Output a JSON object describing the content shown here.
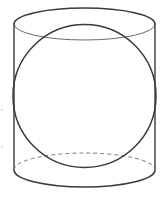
{
  "figure": {
    "width": 164,
    "height": 197,
    "colors": {
      "background": "#ffffff",
      "stroke_dark": "#3a3a3a",
      "stroke_light": "#6a6a6a",
      "dashed": "#7a7a7a"
    },
    "cylinder": {
      "left_x": 14,
      "right_x": 155,
      "top_ellipse": {
        "cx": 84.5,
        "cy": 24,
        "rx": 70.5,
        "ry": 16
      },
      "bottom_ellipse": {
        "cx": 84.5,
        "cy": 170,
        "rx": 70.5,
        "ry": 17
      }
    },
    "sphere": {
      "cx": 84.5,
      "cy": 96,
      "r": 72
    }
  }
}
